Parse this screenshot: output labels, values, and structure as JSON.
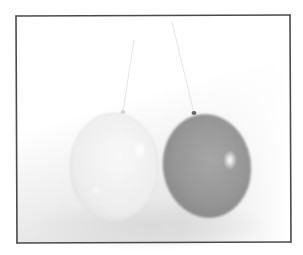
{
  "image": {
    "description": "Grayscale photograph of two balloons hanging on strings, drawn within a hand-sketched rectangular frame",
    "width": 303,
    "height": 255
  },
  "frame": {
    "stroke_color": "#4a4a4a",
    "corners": [
      [
        16,
        16
      ],
      [
        290,
        15
      ],
      [
        291,
        242
      ],
      [
        17,
        243
      ]
    ]
  },
  "background": {
    "top_color": "#ffffff",
    "shadow_color": "#e4e4e4"
  },
  "balloons": [
    {
      "name": "light-balloon",
      "center": [
        114,
        167
      ],
      "rx": 44,
      "ry": 54,
      "fill": "#f0f0f0",
      "edge": "#dcdcdc",
      "highlight": [
        140,
        150
      ],
      "knot": [
        123,
        111
      ],
      "string_top": [
        134,
        40
      ]
    },
    {
      "name": "dark-balloon",
      "center": [
        207,
        166
      ],
      "rx": 44,
      "ry": 52,
      "fill": "#9c9c9c",
      "edge": "#7e7e7e",
      "highlight": [
        230,
        160
      ],
      "knot": [
        194,
        113
      ],
      "string_top": [
        172,
        22
      ]
    }
  ]
}
